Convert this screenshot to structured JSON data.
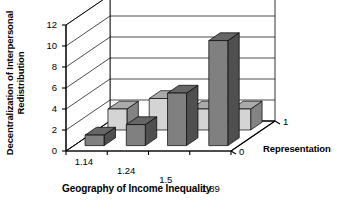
{
  "chart_data": {
    "type": "bar",
    "title": "",
    "subtitle": "",
    "projection": "3d",
    "xlabel": "Geography of Income Inequality",
    "ylabel": "Decentralization of Interpersonal Redistribution",
    "ylabel_lines": [
      "Decentralization of Interpersonal",
      "Redistribution"
    ],
    "zlabel": "Representation",
    "categories": [
      "1.14",
      "1.24",
      "1.5",
      "1.89"
    ],
    "z_categories": [
      "0",
      "1"
    ],
    "series": [
      {
        "name": "0",
        "depth_index": 0,
        "color": "#808080",
        "values": [
          1,
          2,
          5,
          10
        ]
      },
      {
        "name": "1",
        "depth_index": 1,
        "color": "#d4d4d4",
        "values": [
          2,
          3,
          2,
          2
        ]
      }
    ],
    "ylim": [
      0,
      12
    ],
    "yticks": [
      "0",
      "2",
      "4",
      "6",
      "8",
      "10",
      "12"
    ],
    "ytick_values": [
      0,
      2,
      4,
      6,
      8,
      10,
      12
    ],
    "grid": true,
    "grid_orientation": "horizontal-on-back-wall",
    "legend": "none",
    "colors": {
      "series_front": "#808080",
      "series_back": "#d4d4d4",
      "axis": "#000000",
      "gridline": "#000000",
      "background": "#ffffff"
    }
  }
}
